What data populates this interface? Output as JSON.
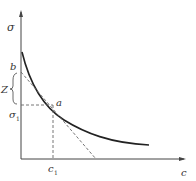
{
  "diagram": {
    "type": "curve-with-tangent",
    "axes": {
      "y_label": "σ",
      "x_label": "c"
    },
    "points": {
      "tangent_point": "a",
      "intercept_point": "b"
    },
    "labels": {
      "sigma1": "σ",
      "sigma1_sub": "1",
      "c1": "c",
      "c1_sub": "1",
      "brace": "Z",
      "a": "a",
      "b": "b"
    },
    "colors": {
      "curve": "#222222",
      "axis": "#444444",
      "dashed": "#666666"
    }
  }
}
